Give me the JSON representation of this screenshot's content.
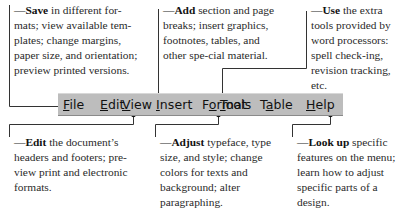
{
  "menu": {
    "items": [
      {
        "label": "File",
        "mnemonic": "F",
        "rest": "ile",
        "left": 5
      },
      {
        "label": "Edit",
        "mnemonic": "E",
        "rest": "dit",
        "left": 42
      },
      {
        "label": "View",
        "mnemonic": "V",
        "rest": "iew",
        "left": 75
      },
      {
        "label": "Insert",
        "mnemonic": "I",
        "rest": "nsert",
        "left": 97
      },
      {
        "label": "Format",
        "mnemonic": "o",
        "pre": "F",
        "rest": "rmat",
        "left": 145
      },
      {
        "label": "Tools",
        "mnemonic": "T",
        "rest": "ools",
        "left": 195
      },
      {
        "label": "Table",
        "mnemonic": "a",
        "pre": "T",
        "rest": "ble",
        "left": 237
      },
      {
        "label": "Help",
        "mnemonic": "H",
        "rest": "elp",
        "left": 270
      }
    ],
    "background": "#bdbdbd"
  },
  "notes": {
    "file": {
      "keyword": "Save",
      "text": " in different for-mats; view available tem-plates; change margins, paper size, and orientation; preview printed versions."
    },
    "insert": {
      "keyword": "Add",
      "text": " section and page breaks; insert graphics, footnotes, tables, and other spe-cial material."
    },
    "tools": {
      "keyword": "Use",
      "text": " the extra tools provided by word processors: spell check-ing, revision tracking, etc."
    },
    "view": {
      "keyword": "Edit",
      "text": " the document’s headers and footers; pre-view print and electronic formats."
    },
    "format": {
      "keyword": "Adjust",
      "text": " typeface, type size, and style; change colors for texts and background; alter paragraphing."
    },
    "help": {
      "keyword": "Look up",
      "text": " specific features on the menu; learn how to adjust specific parts of a design."
    }
  },
  "dash": "—"
}
